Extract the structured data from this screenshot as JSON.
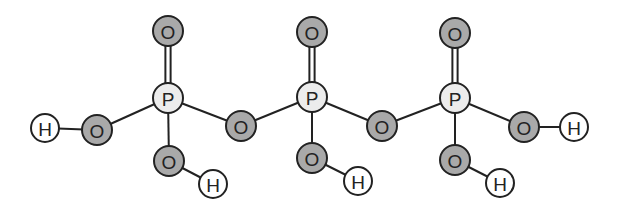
{
  "colors": {
    "oxygen_fill": "#a9a9a9",
    "phosphorus_fill": "#ececec",
    "hydrogen_fill": "#ffffff",
    "stroke": "#222222",
    "background": "#ffffff"
  },
  "atoms": [
    {
      "id": "H1",
      "label": "H",
      "element": "hydrogen",
      "x": 45,
      "y": 128,
      "r": 14
    },
    {
      "id": "O1",
      "label": "O",
      "element": "oxygen",
      "x": 97,
      "y": 130,
      "r": 15
    },
    {
      "id": "P1",
      "label": "P",
      "element": "phosphorus",
      "x": 168,
      "y": 98,
      "r": 15
    },
    {
      "id": "O2",
      "label": "O",
      "element": "oxygen",
      "x": 168,
      "y": 31,
      "r": 15
    },
    {
      "id": "O3",
      "label": "O",
      "element": "oxygen",
      "x": 169,
      "y": 161,
      "r": 15
    },
    {
      "id": "H2",
      "label": "H",
      "element": "hydrogen",
      "x": 213,
      "y": 184,
      "r": 14
    },
    {
      "id": "O4",
      "label": "O",
      "element": "oxygen",
      "x": 241,
      "y": 126,
      "r": 15
    },
    {
      "id": "P2",
      "label": "P",
      "element": "phosphorus",
      "x": 312,
      "y": 97,
      "r": 15
    },
    {
      "id": "O5",
      "label": "O",
      "element": "oxygen",
      "x": 312,
      "y": 32,
      "r": 15
    },
    {
      "id": "O6",
      "label": "O",
      "element": "oxygen",
      "x": 312,
      "y": 158,
      "r": 15
    },
    {
      "id": "H3",
      "label": "H",
      "element": "hydrogen",
      "x": 358,
      "y": 181,
      "r": 14
    },
    {
      "id": "O7",
      "label": "O",
      "element": "oxygen",
      "x": 382,
      "y": 126,
      "r": 15
    },
    {
      "id": "P3",
      "label": "P",
      "element": "phosphorus",
      "x": 455,
      "y": 98,
      "r": 15
    },
    {
      "id": "O8",
      "label": "O",
      "element": "oxygen",
      "x": 455,
      "y": 33,
      "r": 15
    },
    {
      "id": "O9",
      "label": "O",
      "element": "oxygen",
      "x": 455,
      "y": 160,
      "r": 15
    },
    {
      "id": "H4",
      "label": "H",
      "element": "hydrogen",
      "x": 500,
      "y": 183,
      "r": 14
    },
    {
      "id": "O10",
      "label": "O",
      "element": "oxygen",
      "x": 524,
      "y": 127,
      "r": 15
    },
    {
      "id": "H5",
      "label": "H",
      "element": "hydrogen",
      "x": 574,
      "y": 127,
      "r": 14
    }
  ],
  "bonds": [
    {
      "from": "H1",
      "to": "O1",
      "order": 1
    },
    {
      "from": "O1",
      "to": "P1",
      "order": 1
    },
    {
      "from": "P1",
      "to": "O2",
      "order": 2
    },
    {
      "from": "P1",
      "to": "O3",
      "order": 1
    },
    {
      "from": "O3",
      "to": "H2",
      "order": 1
    },
    {
      "from": "P1",
      "to": "O4",
      "order": 1
    },
    {
      "from": "O4",
      "to": "P2",
      "order": 1
    },
    {
      "from": "P2",
      "to": "O5",
      "order": 2
    },
    {
      "from": "P2",
      "to": "O6",
      "order": 1
    },
    {
      "from": "O6",
      "to": "H3",
      "order": 1
    },
    {
      "from": "P2",
      "to": "O7",
      "order": 1
    },
    {
      "from": "O7",
      "to": "P3",
      "order": 1
    },
    {
      "from": "P3",
      "to": "O8",
      "order": 2
    },
    {
      "from": "P3",
      "to": "O9",
      "order": 1
    },
    {
      "from": "O9",
      "to": "H4",
      "order": 1
    },
    {
      "from": "P3",
      "to": "O10",
      "order": 1
    },
    {
      "from": "O10",
      "to": "H5",
      "order": 1
    }
  ]
}
